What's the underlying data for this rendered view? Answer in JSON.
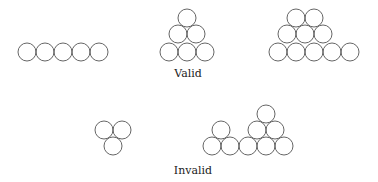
{
  "labels": {
    "valid": "Valid",
    "invalid": "Invalid"
  },
  "style": {
    "circle_radius": 9,
    "stroke_color": "#555555"
  },
  "groups": [
    {
      "name": "valid-row-of-5",
      "category": "valid",
      "circles": [
        [
          27,
          52
        ],
        [
          45,
          52
        ],
        [
          63,
          52
        ],
        [
          81,
          52
        ],
        [
          99,
          52
        ]
      ]
    },
    {
      "name": "valid-triangle-6",
      "category": "valid",
      "circles": [
        [
          187,
          18
        ],
        [
          178,
          34
        ],
        [
          196,
          34
        ],
        [
          169,
          52
        ],
        [
          187,
          52
        ],
        [
          205,
          52
        ]
      ]
    },
    {
      "name": "valid-trapezoid-10",
      "category": "valid",
      "circles": [
        [
          296,
          18
        ],
        [
          314,
          18
        ],
        [
          287,
          34
        ],
        [
          305,
          34
        ],
        [
          323,
          34
        ],
        [
          278,
          52
        ],
        [
          296,
          52
        ],
        [
          314,
          52
        ],
        [
          332,
          52
        ],
        [
          350,
          52
        ]
      ]
    },
    {
      "name": "invalid-inverted-3",
      "category": "invalid",
      "circles": [
        [
          104,
          130
        ],
        [
          122,
          130
        ],
        [
          113,
          146
        ]
      ]
    },
    {
      "name": "invalid-split-base-9",
      "category": "invalid",
      "circles": [
        [
          221,
          130
        ],
        [
          212,
          146
        ],
        [
          230,
          146
        ],
        [
          266,
          114
        ],
        [
          257,
          130
        ],
        [
          275,
          130
        ],
        [
          248,
          146
        ],
        [
          266,
          146
        ],
        [
          284,
          146
        ]
      ]
    }
  ],
  "label_positions": {
    "valid": [
      188,
      67
    ],
    "invalid": [
      193,
      164
    ]
  }
}
